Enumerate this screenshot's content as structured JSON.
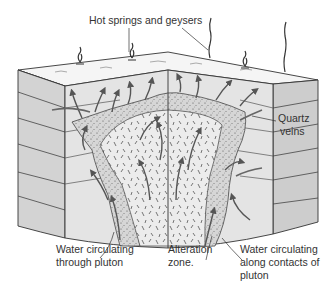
{
  "diagram": {
    "labels": {
      "hot_springs": "Hot springs and geysers",
      "quartz_veins_line1": "Quartz",
      "quartz_veins_line2": "veins",
      "water_pluton_line1": "Water circulating",
      "water_pluton_line2": "through pluton",
      "alteration_line1": "Alteration",
      "alteration_line2": "zone.",
      "water_contacts_line1": "Water circulating",
      "water_contacts_line2": "along contacts of",
      "water_contacts_line3": "pluton"
    },
    "colors": {
      "background": "#ffffff",
      "top_surface": "#f4f4f4",
      "side_faces": "#cfcfcf",
      "front_face": "#e2e2e2",
      "pluton": "#ececec",
      "alteration_zone": "#dadada",
      "line": "#333333",
      "arrow": "#555555"
    }
  }
}
